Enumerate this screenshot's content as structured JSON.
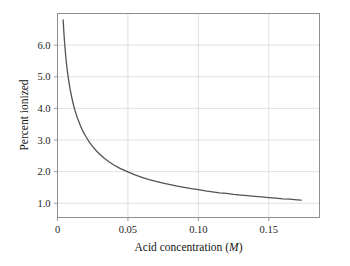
{
  "chart_data": {
    "type": "line",
    "title": "",
    "subtitle": "",
    "xlabel": "Acid concentration (M)",
    "xlabel_plain": "Acid concentration (",
    "xlabel_italic": "M",
    "xlabel_close": ")",
    "ylabel": "Percent ionized",
    "xlim": [
      0.0,
      0.186
    ],
    "ylim": [
      0.55,
      7.0
    ],
    "xticks": [
      0,
      0.05,
      0.1,
      0.15
    ],
    "xtick_labels": [
      "0",
      "0.05",
      "0.10",
      "0.15"
    ],
    "yticks": [
      1.0,
      2.0,
      3.0,
      4.0,
      5.0,
      6.0
    ],
    "ytick_labels": [
      "1.0",
      "2.0",
      "3.0",
      "4.0",
      "5.0",
      "6.0"
    ],
    "grid": true,
    "grid_color": "#d8d8d8",
    "frame_color": "#8e8e8e",
    "line_color": "#53534f",
    "line_width": 1.3,
    "legend": null,
    "annotations": [],
    "series": [
      {
        "name": "Percent ionized",
        "x": [
          0.004,
          0.0045,
          0.005,
          0.0055,
          0.006,
          0.0065,
          0.007,
          0.008,
          0.009,
          0.01,
          0.011,
          0.0125,
          0.014,
          0.016,
          0.018,
          0.02,
          0.0225,
          0.025,
          0.0275,
          0.03,
          0.033,
          0.036,
          0.04,
          0.044,
          0.048,
          0.05,
          0.055,
          0.06,
          0.065,
          0.07,
          0.075,
          0.08,
          0.085,
          0.09,
          0.095,
          0.1,
          0.105,
          0.11,
          0.115,
          0.12,
          0.125,
          0.13,
          0.135,
          0.14,
          0.145,
          0.15,
          0.155,
          0.16,
          0.165,
          0.17,
          0.173
        ],
        "y": [
          6.8,
          6.42,
          6.1,
          5.82,
          5.58,
          5.37,
          5.18,
          4.86,
          4.59,
          4.37,
          4.17,
          3.92,
          3.71,
          3.48,
          3.28,
          3.12,
          2.94,
          2.79,
          2.66,
          2.55,
          2.43,
          2.33,
          2.21,
          2.11,
          2.03,
          1.99,
          1.9,
          1.82,
          1.75,
          1.69,
          1.64,
          1.59,
          1.54,
          1.5,
          1.46,
          1.43,
          1.39,
          1.36,
          1.33,
          1.31,
          1.28,
          1.26,
          1.24,
          1.22,
          1.2,
          1.18,
          1.16,
          1.14,
          1.13,
          1.11,
          1.1
        ]
      }
    ]
  },
  "figure": {
    "background_color": "#ffffff"
  }
}
